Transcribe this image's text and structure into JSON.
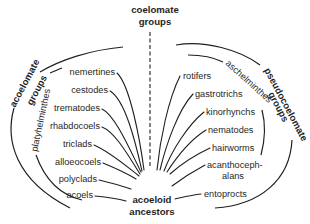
{
  "diagram": {
    "type": "phylogenetic-tree",
    "root": {
      "label_line1": "acoeloid",
      "label_line2": "ancestors"
    },
    "top_center": {
      "label_line1": "coelomate",
      "label_line2": "groups"
    },
    "left_group": {
      "outer_label_line1": "acoelomate",
      "outer_label_line2": "groups",
      "inner_label": "platyhelminthes",
      "taxa": [
        "nemertines",
        "cestodes",
        "trematodes",
        "rhabdocoels",
        "triclads",
        "alloeocoels",
        "polyclads",
        "acoels"
      ]
    },
    "right_group": {
      "outer_label_line1": "pseudocoelomate",
      "outer_label_line2": "groups",
      "inner_label": "aschelminthes",
      "taxa": [
        "rotifers",
        "gastrotrichs",
        "kinorhynchs",
        "nematodes",
        "hairworms",
        "acanthoceph-",
        "alans",
        "entoprocts"
      ]
    }
  }
}
